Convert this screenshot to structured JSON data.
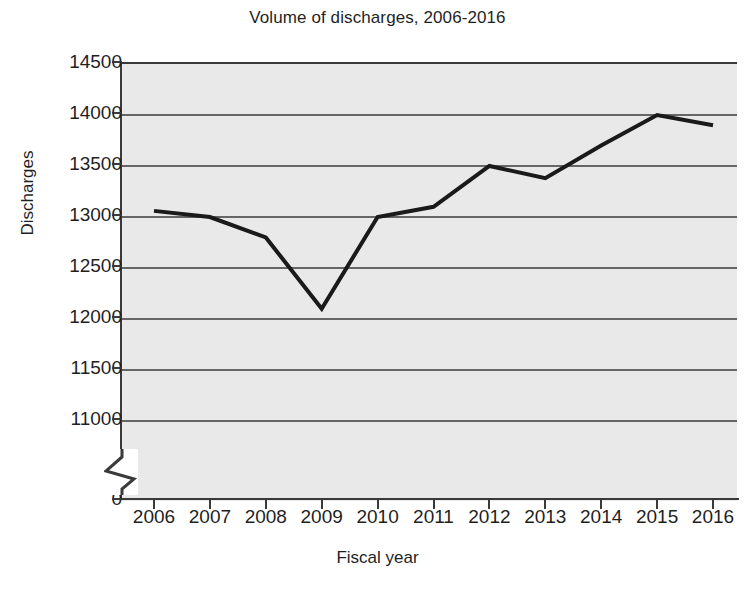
{
  "chart_data": {
    "type": "line",
    "title": "Volume of discharges, 2006-2016",
    "xlabel": "Fiscal year",
    "ylabel": "Discharges",
    "categories": [
      "2006",
      "2007",
      "2008",
      "2009",
      "2010",
      "2011",
      "2012",
      "2013",
      "2014",
      "2015",
      "2016"
    ],
    "x": [
      2006,
      2007,
      2008,
      2009,
      2010,
      2011,
      2012,
      2013,
      2014,
      2015,
      2016
    ],
    "values": [
      13060,
      13000,
      12800,
      12100,
      13000,
      13100,
      13500,
      13380,
      13700,
      14000,
      13900
    ],
    "series": [
      {
        "name": "Discharges",
        "values": [
          13060,
          13000,
          12800,
          12100,
          13000,
          13100,
          13500,
          13380,
          13700,
          14000,
          13900
        ]
      }
    ],
    "ylim": [
      11000,
      14500
    ],
    "yticks": [
      14500,
      14000,
      13500,
      13000,
      12500,
      12000,
      11500,
      11000
    ],
    "ytick_labels": [
      "14500",
      "14000",
      "13500",
      "13000",
      "12500",
      "12000",
      "11500",
      "11000"
    ],
    "y_axis_origin_label": "0",
    "y_axis_broken": true,
    "grid": true,
    "grid_axis": "y",
    "legend": false,
    "legend_position": "none",
    "line_color": "#1a1a1a",
    "plot_background": "#e9e9e9",
    "figure_background": "#ffffff",
    "gridline_color": "#3a3a3a",
    "markers": false
  },
  "axes": {
    "y_tick_labels": [
      "14500",
      "14000",
      "13500",
      "13000",
      "12500",
      "12000",
      "11500",
      "11000",
      "0"
    ],
    "x_tick_labels": [
      "2006",
      "2007",
      "2008",
      "2009",
      "2010",
      "2011",
      "2012",
      "2013",
      "2014",
      "2015",
      "2016"
    ]
  }
}
